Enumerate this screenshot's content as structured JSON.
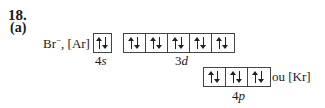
{
  "problem": {
    "number": "18.",
    "part": "(a)"
  },
  "configuration": {
    "ion": "Br",
    "charge": "−",
    "core": ", [Ar]",
    "orbitals": [
      {
        "name": "4s",
        "n": "4",
        "l": "s",
        "boxes": 1,
        "electrons": "paired"
      },
      {
        "name": "3d",
        "n": "3",
        "l": "d",
        "boxes": 5,
        "electrons": "paired"
      },
      {
        "name": "4p",
        "n": "4",
        "l": "p",
        "boxes": 3,
        "electrons": "paired"
      }
    ],
    "alternative": "ou [Kr]"
  }
}
